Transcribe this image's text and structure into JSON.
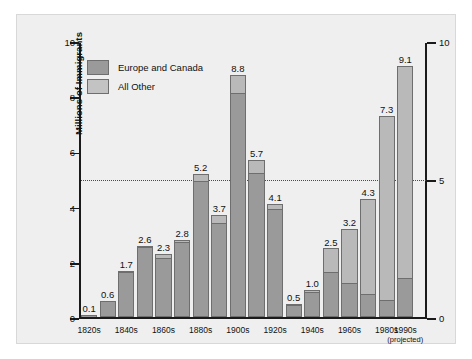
{
  "chart_data": {
    "type": "bar",
    "title": "",
    "xlabel": "",
    "ylabel": "Millions of Immigrants",
    "ylim": [
      0,
      10
    ],
    "yticks": [
      "0",
      "2",
      "4",
      "6",
      "8",
      "10"
    ],
    "y2ticks": [
      "0",
      "5",
      "10"
    ],
    "grid": false,
    "reference_line": 5,
    "stacked": true,
    "legend_position": "top-left",
    "categories": [
      "1820s",
      "1830s",
      "1840s",
      "1850s",
      "1860s",
      "1870s",
      "1880s",
      "1890s",
      "1900s",
      "1910s",
      "1920s",
      "1930s",
      "1940s",
      "1950s",
      "1960s",
      "1970s",
      "1980s",
      "1990s"
    ],
    "tick_labels": [
      "1820s",
      "",
      "1840s",
      "",
      "1860s",
      "",
      "1880s",
      "",
      "1900s",
      "",
      "1920s",
      "",
      "1940s",
      "",
      "1960s",
      "",
      "1980s",
      "1990s"
    ],
    "series": [
      {
        "name": "Europe and Canada",
        "color": "#9a9a9a",
        "values": [
          0.1,
          0.6,
          1.6,
          2.5,
          2.1,
          2.7,
          4.9,
          3.4,
          8.1,
          5.2,
          3.9,
          0.4,
          0.9,
          1.6,
          1.2,
          0.8,
          0.6,
          1.4
        ]
      },
      {
        "name": "All Other",
        "color": "#c3c3c3",
        "values": [
          0.0,
          0.0,
          0.1,
          0.1,
          0.2,
          0.1,
          0.3,
          0.3,
          0.7,
          0.5,
          0.2,
          0.1,
          0.1,
          0.9,
          2.0,
          3.5,
          6.7,
          7.7
        ]
      }
    ],
    "totals": [
      0.1,
      0.6,
      1.7,
      2.6,
      2.3,
      2.8,
      5.2,
      3.7,
      8.8,
      5.7,
      4.1,
      0.5,
      1.0,
      2.5,
      3.2,
      4.3,
      7.3,
      9.1
    ],
    "data_labels": [
      "0.1",
      "0.6",
      "1.7",
      "2.6",
      "2.3",
      "2.8",
      "5.2",
      "3.7",
      "8.8",
      "5.7",
      "4.1",
      "0.5",
      "1.0",
      "2.5",
      "3.2",
      "4.3",
      "7.3",
      "9.1"
    ],
    "annotations": [
      "(projected)"
    ]
  },
  "legend": {
    "items": [
      {
        "label": "Europe and Canada",
        "swatch": "dark"
      },
      {
        "label": "All Other",
        "swatch": "light"
      }
    ]
  },
  "axes": {
    "y_left_title": "Millions of Immigrants",
    "projected_note": "(projected)"
  }
}
